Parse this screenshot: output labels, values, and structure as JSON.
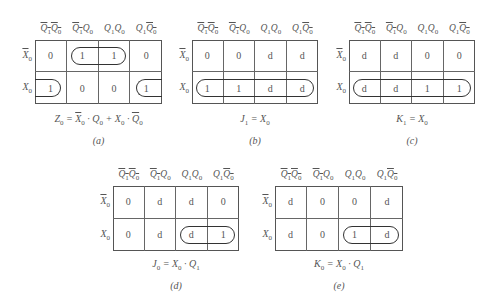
{
  "column_headers": [
    "Q̄1Q̄0",
    "Q̄1Q0",
    "Q1Q0",
    "Q1Q̄0"
  ],
  "row_headers": [
    "X̄0",
    "X0"
  ],
  "kmaps": [
    {
      "id": "a",
      "caption": "(a)",
      "equation": "Z0 = X̄0 · Q0 + X0 · Q̄0",
      "cells": [
        [
          "0",
          "1",
          "1",
          "0"
        ],
        [
          "1",
          "0",
          "0",
          "1"
        ]
      ]
    },
    {
      "id": "b",
      "caption": "(b)",
      "equation": "J1 = X0",
      "cells": [
        [
          "0",
          "0",
          "d",
          "d"
        ],
        [
          "1",
          "1",
          "d",
          "d"
        ]
      ]
    },
    {
      "id": "c",
      "caption": "(c)",
      "equation": "K1 = X0",
      "cells": [
        [
          "d",
          "d",
          "0",
          "0"
        ],
        [
          "d",
          "d",
          "1",
          "1"
        ]
      ]
    },
    {
      "id": "d",
      "caption": "(d)",
      "equation": "J0 = X0 · Q1",
      "cells": [
        [
          "0",
          "d",
          "d",
          "0"
        ],
        [
          "0",
          "d",
          "d",
          "1"
        ]
      ]
    },
    {
      "id": "e",
      "caption": "(e)",
      "equation": "K0 = X0 · Q1",
      "cells": [
        [
          "d",
          "0",
          "0",
          "d"
        ],
        [
          "d",
          "0",
          "1",
          "d"
        ]
      ]
    }
  ]
}
